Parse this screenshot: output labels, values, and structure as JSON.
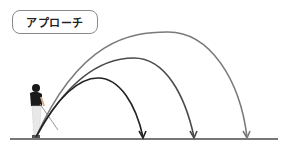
{
  "title": "アプローチ",
  "diagram": {
    "ground": {
      "x1": 10,
      "x2": 278,
      "y": 139,
      "color": "#777777"
    },
    "origin": {
      "x": 36,
      "y": 137
    },
    "trajectories": [
      {
        "name": "low",
        "color": "#222222",
        "landing_x": 143,
        "peak": [
          98,
          78
        ]
      },
      {
        "name": "mid",
        "color": "#4a4a4a",
        "landing_x": 194,
        "peak": [
          134,
          58
        ]
      },
      {
        "name": "high",
        "color": "#7a7a7a",
        "landing_x": 247,
        "peak": [
          168,
          32
        ]
      }
    ],
    "figure": "golfer-silhouette"
  }
}
